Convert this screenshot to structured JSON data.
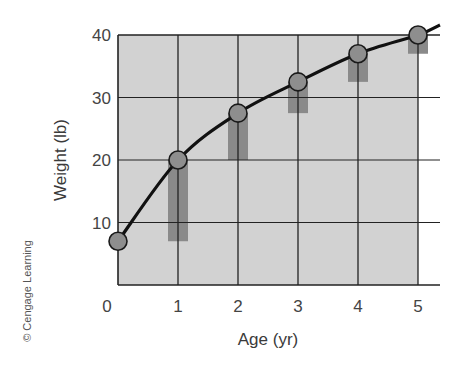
{
  "chart_data": {
    "type": "line",
    "title": "",
    "xlabel": "Age (yr)",
    "ylabel": "Weight (lb)",
    "x": [
      0,
      1,
      2,
      3,
      4,
      5
    ],
    "x_ticks": [
      "0",
      "1",
      "2",
      "3",
      "4",
      "5"
    ],
    "y_ticks": [
      "10",
      "20",
      "30",
      "40"
    ],
    "xlim": [
      0,
      5
    ],
    "ylim": [
      0,
      40
    ],
    "grid": true,
    "legend": null,
    "series": [
      {
        "name": "Weight",
        "type": "line",
        "marker": "circle",
        "values": [
          7,
          20,
          27.5,
          32.5,
          37,
          40
        ]
      },
      {
        "name": "Yearly gain",
        "type": "bar",
        "bars": [
          {
            "x": 1,
            "from": 7,
            "to": 20
          },
          {
            "x": 2,
            "from": 20,
            "to": 27.5
          },
          {
            "x": 3,
            "from": 27.5,
            "to": 32.5
          },
          {
            "x": 4,
            "from": 32.5,
            "to": 37
          },
          {
            "x": 5,
            "from": 37,
            "to": 40
          }
        ]
      }
    ],
    "annotations": [
      "© Cengage Learning"
    ]
  },
  "colors": {
    "plot_fill": "#d2d2d2",
    "grid": "#222222",
    "bar": "#8a8a8a",
    "marker_fill": "#8e8e8e",
    "line": "#111111"
  },
  "labels": {
    "xlabel": "Age (yr)",
    "ylabel": "Weight (lb)",
    "credit": "© Cengage Learning",
    "y0": "0"
  }
}
